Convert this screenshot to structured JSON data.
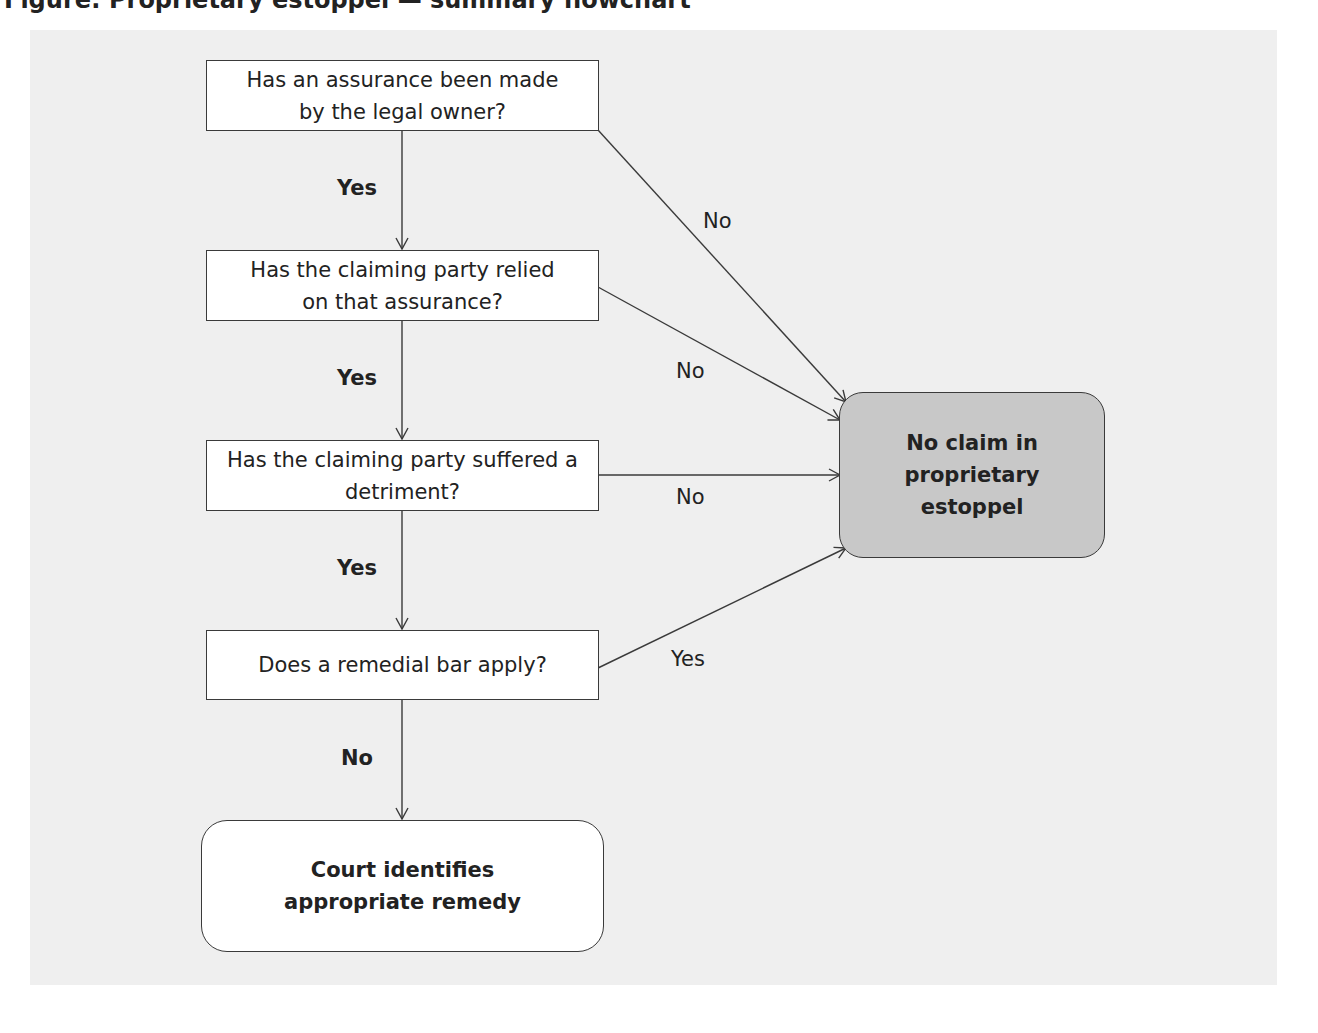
{
  "caption": "Figure: Proprietary estoppel — summary flowchart",
  "nodes": {
    "q1": "Has an assurance been made by the legal owner?",
    "q2": "Has the claiming party relied on that assurance?",
    "q3": "Has the claiming party suffered a detriment?",
    "q4": "Does a remedial bar apply?",
    "outcome_remedy": "Court identifies appropriate remedy",
    "outcome_no_claim": "No claim in proprietary estoppel"
  },
  "edge_labels": {
    "q1_to_q2": "Yes",
    "q2_to_q3": "Yes",
    "q3_to_q4": "Yes",
    "q4_to_remedy": "No",
    "q1_to_no_claim": "No",
    "q2_to_no_claim": "No",
    "q3_to_no_claim": "No",
    "q4_to_no_claim": "Yes"
  },
  "colors": {
    "panel_background": "#efefef",
    "terminal_no_claim_fill": "#c8c8c8",
    "box_fill": "#ffffff",
    "stroke": "#3a3a3a"
  }
}
